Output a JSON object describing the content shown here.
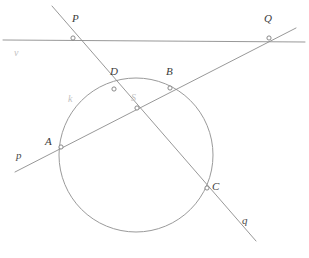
{
  "figure": {
    "background_color": "#ffffff",
    "line_color": "#8c8c8c",
    "circle_color": "#9a9a9a",
    "label_color": "#3a3a3a",
    "faint_label_color": "#c2c2c2"
  },
  "points": [
    {
      "id": "P",
      "label": "P",
      "x": 73,
      "y": 38,
      "label_x": 72,
      "label_y": 22
    },
    {
      "id": "Q",
      "label": "Q",
      "x": 269,
      "y": 38,
      "label_x": 264,
      "label_y": 22
    },
    {
      "id": "D",
      "label": "D",
      "x": 114,
      "y": 89,
      "label_x": 110,
      "label_y": 75
    },
    {
      "id": "B",
      "label": "B",
      "x": 170,
      "y": 88,
      "label_x": 166,
      "label_y": 75
    },
    {
      "id": "S",
      "label": "S",
      "x": 137,
      "y": 108,
      "label_x": 131,
      "label_y": 101
    },
    {
      "id": "A",
      "label": "A",
      "x": 61,
      "y": 147,
      "label_x": 45,
      "label_y": 145
    },
    {
      "id": "C",
      "label": "C",
      "x": 207,
      "y": 188,
      "label_x": 212,
      "label_y": 190
    }
  ],
  "lines": [
    {
      "id": "v",
      "label": "v",
      "x1": 3,
      "y1": 40,
      "x2": 305,
      "y2": 42,
      "label_x": 14,
      "label_y": 56
    },
    {
      "id": "p",
      "label": "p",
      "x1": 15,
      "y1": 172,
      "x2": 296,
      "y2": 28,
      "label_x": 16,
      "label_y": 159
    },
    {
      "id": "q",
      "label": "q",
      "x1": 52,
      "y1": 6,
      "x2": 256,
      "y2": 241,
      "label_x": 242,
      "label_y": 224
    }
  ],
  "circle": {
    "id": "k",
    "label": "k",
    "cx": 136,
    "cy": 155,
    "r": 77,
    "label_x": 68,
    "label_y": 102
  }
}
